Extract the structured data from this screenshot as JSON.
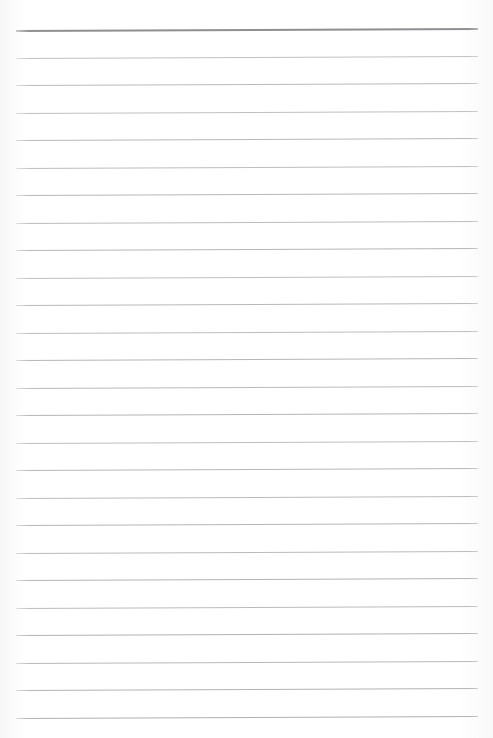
{
  "page": {
    "width": 493,
    "height": 738,
    "background_color": "#ffffff",
    "paper_tone_color": "#fefefe",
    "orientation": "portrait",
    "margin_left": 16,
    "margin_right": 15,
    "margin_top": 30,
    "margin_bottom": 19,
    "has_vertical_margin_rule": false,
    "has_holes": false,
    "has_text": false,
    "content_text": ""
  },
  "ruling": {
    "line_count": 26,
    "line_color": "#a9a9ad",
    "first_line_color": "#8e8e93",
    "line_thickness": 1,
    "first_line_thickness": 2,
    "line_spacing": 27.5,
    "first_line_y": 30,
    "line_left_x": 16,
    "line_right_x": 478,
    "line_width": 462,
    "tilt_degrees": -0.25,
    "style": "wide-ruled"
  },
  "lines": [
    {
      "index": 1,
      "y": 30.0,
      "opacity": 1.0,
      "emphasis": true
    },
    {
      "index": 2,
      "y": 57.5,
      "opacity": 0.72,
      "emphasis": false
    },
    {
      "index": 3,
      "y": 85.0,
      "opacity": 0.8,
      "emphasis": false
    },
    {
      "index": 4,
      "y": 112.5,
      "opacity": 0.74,
      "emphasis": false
    },
    {
      "index": 5,
      "y": 140.0,
      "opacity": 0.82,
      "emphasis": false
    },
    {
      "index": 6,
      "y": 167.5,
      "opacity": 0.76,
      "emphasis": false
    },
    {
      "index": 7,
      "y": 195.0,
      "opacity": 0.84,
      "emphasis": false
    },
    {
      "index": 8,
      "y": 222.5,
      "opacity": 0.78,
      "emphasis": false
    },
    {
      "index": 9,
      "y": 250.0,
      "opacity": 0.86,
      "emphasis": false
    },
    {
      "index": 10,
      "y": 277.5,
      "opacity": 0.75,
      "emphasis": false
    },
    {
      "index": 11,
      "y": 305.0,
      "opacity": 0.83,
      "emphasis": false
    },
    {
      "index": 12,
      "y": 332.5,
      "opacity": 0.77,
      "emphasis": false
    },
    {
      "index": 13,
      "y": 360.0,
      "opacity": 0.85,
      "emphasis": false
    },
    {
      "index": 14,
      "y": 387.5,
      "opacity": 0.79,
      "emphasis": false
    },
    {
      "index": 15,
      "y": 415.0,
      "opacity": 0.87,
      "emphasis": false
    },
    {
      "index": 16,
      "y": 442.5,
      "opacity": 0.76,
      "emphasis": false
    },
    {
      "index": 17,
      "y": 470.0,
      "opacity": 0.84,
      "emphasis": false
    },
    {
      "index": 18,
      "y": 497.5,
      "opacity": 0.78,
      "emphasis": false
    },
    {
      "index": 19,
      "y": 525.0,
      "opacity": 0.86,
      "emphasis": false
    },
    {
      "index": 20,
      "y": 552.5,
      "opacity": 0.8,
      "emphasis": false
    },
    {
      "index": 21,
      "y": 580.0,
      "opacity": 0.88,
      "emphasis": false
    },
    {
      "index": 22,
      "y": 607.5,
      "opacity": 0.79,
      "emphasis": false
    },
    {
      "index": 23,
      "y": 635.0,
      "opacity": 0.9,
      "emphasis": false
    },
    {
      "index": 24,
      "y": 662.5,
      "opacity": 0.82,
      "emphasis": false
    },
    {
      "index": 25,
      "y": 690.0,
      "opacity": 0.88,
      "emphasis": false
    },
    {
      "index": 26,
      "y": 717.5,
      "opacity": 0.92,
      "emphasis": false
    }
  ]
}
